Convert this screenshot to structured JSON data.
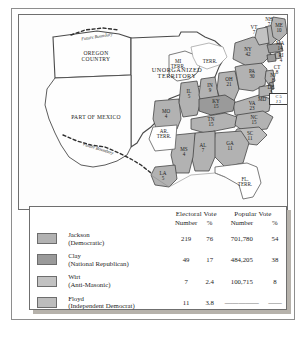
{
  "map": {
    "territories": [
      {
        "name": "OREGON\nCOUNTRY"
      },
      {
        "name": "UNORGANIZED\nTERRITORY"
      },
      {
        "name": "PART OF MEXICO"
      },
      {
        "name": "MI\nTERR."
      },
      {
        "name": "AR.\nTERR."
      },
      {
        "name": "FL.\nTERR."
      }
    ],
    "boundary_labels": [
      {
        "text": "Future Boundary"
      },
      {
        "text": "Future Boundary"
      }
    ],
    "states": [
      {
        "abbr": "ME",
        "votes": "10",
        "party": "jackson"
      },
      {
        "abbr": "NH",
        "votes": "7",
        "party": "jackson"
      },
      {
        "abbr": "VT",
        "votes": "7",
        "party": "wirt"
      },
      {
        "abbr": "MA",
        "votes": "14",
        "party": "clay"
      },
      {
        "abbr": "RI",
        "votes": "4",
        "party": "jackson"
      },
      {
        "abbr": "CT",
        "votes": "8",
        "party": "clay"
      },
      {
        "abbr": "NY",
        "votes": "42",
        "party": "jackson"
      },
      {
        "abbr": "NJ",
        "votes": "8",
        "party": "jackson"
      },
      {
        "abbr": "PA",
        "votes": "30",
        "party": "jackson"
      },
      {
        "abbr": "DE",
        "votes": "3",
        "party": "clay"
      },
      {
        "abbr": "MD",
        "votes": "",
        "party": "split"
      },
      {
        "abbr": "OH",
        "votes": "21",
        "party": "jackson"
      },
      {
        "abbr": "IN",
        "votes": "9",
        "party": "jackson"
      },
      {
        "abbr": "IL",
        "votes": "5",
        "party": "jackson"
      },
      {
        "abbr": "MO",
        "votes": "4",
        "party": "jackson"
      },
      {
        "abbr": "KY",
        "votes": "15",
        "party": "clay"
      },
      {
        "abbr": "VA",
        "votes": "23",
        "party": "jackson"
      },
      {
        "abbr": "NC",
        "votes": "15",
        "party": "jackson"
      },
      {
        "abbr": "TN",
        "votes": "15",
        "party": "jackson"
      },
      {
        "abbr": "SC",
        "votes": "11",
        "party": "floyd"
      },
      {
        "abbr": "GA",
        "votes": "11",
        "party": "jackson"
      },
      {
        "abbr": "AL",
        "votes": "7",
        "party": "jackson"
      },
      {
        "abbr": "MS",
        "votes": "4",
        "party": "jackson"
      },
      {
        "abbr": "LA",
        "votes": "5",
        "party": "jackson"
      }
    ],
    "maryland_split": {
      "line1": "C 5",
      "line2": "J 3"
    }
  },
  "legend": {
    "headers": {
      "electoral_group": "Electoral Vote",
      "popular_group": "Popular Vote",
      "number": "Number",
      "percent": "%",
      "popular_number": "Number",
      "popular_percent": "%"
    },
    "rows": [
      {
        "candidate": "Jackson",
        "party": "(Democratic)",
        "electoral_number": "219",
        "electoral_percent": "76",
        "popular_number": "701,780",
        "popular_percent": "54",
        "color": "#b2b2b2"
      },
      {
        "candidate": "Clay",
        "party": "(National Republican)",
        "electoral_number": "49",
        "electoral_percent": "17",
        "popular_number": "484,205",
        "popular_percent": "38",
        "color": "#9a9a9a"
      },
      {
        "candidate": "Wirt",
        "party": "(Anti-Masonic)",
        "electoral_number": "7",
        "electoral_percent": "2.4",
        "popular_number": "100,715",
        "popular_percent": "8",
        "color": "#c2c2c2"
      },
      {
        "candidate": "Floyd",
        "party": "(Independent Democrat)",
        "electoral_number": "11",
        "electoral_percent": "3.8",
        "popular_number": "—————",
        "popular_percent": "——",
        "color": "#bdbdbd"
      }
    ]
  }
}
